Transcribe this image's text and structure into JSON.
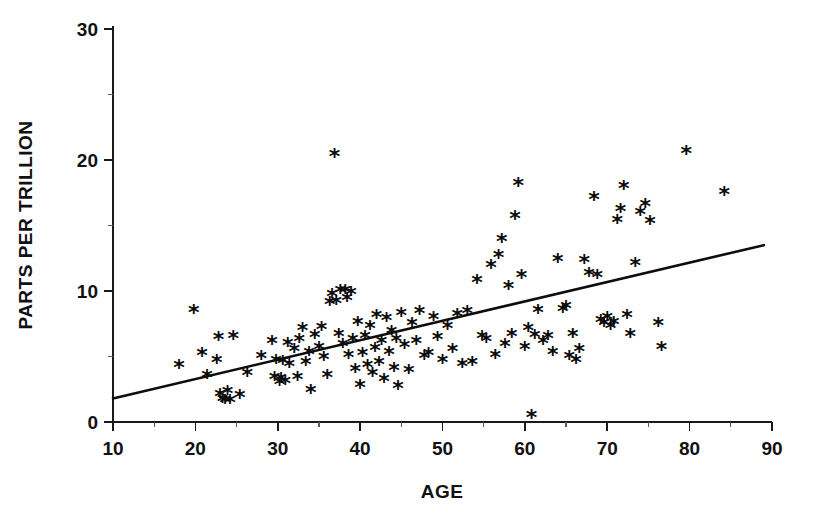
{
  "chart_data": {
    "type": "scatter",
    "title": "",
    "xlabel": "AGE",
    "ylabel": "PARTS PER TRILLION",
    "xlim": [
      10,
      90
    ],
    "ylim": [
      0,
      30
    ],
    "grid": false,
    "legend": null,
    "marker_symbol": "*",
    "marker_color": "#0a0a0a",
    "x_ticks_major": [
      10,
      20,
      30,
      40,
      50,
      60,
      70,
      80,
      90
    ],
    "x_tick_labels": [
      "10",
      "20",
      "30",
      "40",
      "50",
      "60",
      "70",
      "80",
      "90"
    ],
    "x_ticks_minor": [
      15,
      25,
      35,
      45,
      55,
      65,
      75,
      85
    ],
    "y_ticks_major": [
      0,
      10,
      20,
      30
    ],
    "y_tick_labels": [
      "0",
      "10",
      "20",
      "30"
    ],
    "y_ticks_minor": [
      5,
      15,
      25
    ],
    "series": [
      {
        "name": "observations",
        "points": [
          [
            18.0,
            4.2
          ],
          [
            19.8,
            8.4
          ],
          [
            20.8,
            5.1
          ],
          [
            21.4,
            3.4
          ],
          [
            22.6,
            4.6
          ],
          [
            22.8,
            6.3
          ],
          [
            23.0,
            2.0
          ],
          [
            23.3,
            1.6
          ],
          [
            23.6,
            1.5
          ],
          [
            23.9,
            2.2
          ],
          [
            24.2,
            1.5
          ],
          [
            24.6,
            6.4
          ],
          [
            25.4,
            1.9
          ],
          [
            26.3,
            3.6
          ],
          [
            28.0,
            4.9
          ],
          [
            29.3,
            6.0
          ],
          [
            29.6,
            3.3
          ],
          [
            29.8,
            4.6
          ],
          [
            30.2,
            2.9
          ],
          [
            30.4,
            3.2
          ],
          [
            30.6,
            4.5
          ],
          [
            30.9,
            3.0
          ],
          [
            31.2,
            5.9
          ],
          [
            31.4,
            4.3
          ],
          [
            32.0,
            5.4
          ],
          [
            32.4,
            3.3
          ],
          [
            32.6,
            6.2
          ],
          [
            33.0,
            7.0
          ],
          [
            33.4,
            4.4
          ],
          [
            33.8,
            5.2
          ],
          [
            34.0,
            2.3
          ],
          [
            34.5,
            6.5
          ],
          [
            35.0,
            5.6
          ],
          [
            35.3,
            7.1
          ],
          [
            35.6,
            4.8
          ],
          [
            36.0,
            3.4
          ],
          [
            36.3,
            9.0
          ],
          [
            36.6,
            9.6
          ],
          [
            36.9,
            20.3
          ],
          [
            37.1,
            9.1
          ],
          [
            37.4,
            6.6
          ],
          [
            37.6,
            9.9
          ],
          [
            37.9,
            5.8
          ],
          [
            38.2,
            9.9
          ],
          [
            38.4,
            9.3
          ],
          [
            38.6,
            5.0
          ],
          [
            38.9,
            9.8
          ],
          [
            39.1,
            6.2
          ],
          [
            39.4,
            3.9
          ],
          [
            39.7,
            7.5
          ],
          [
            40.0,
            2.7
          ],
          [
            40.3,
            5.1
          ],
          [
            40.6,
            6.4
          ],
          [
            40.9,
            4.2
          ],
          [
            41.2,
            7.2
          ],
          [
            41.5,
            3.6
          ],
          [
            41.8,
            5.5
          ],
          [
            42.0,
            8.0
          ],
          [
            42.3,
            4.4
          ],
          [
            42.6,
            6.0
          ],
          [
            42.9,
            3.1
          ],
          [
            43.2,
            7.8
          ],
          [
            43.5,
            5.2
          ],
          [
            43.8,
            6.8
          ],
          [
            44.1,
            4.0
          ],
          [
            44.4,
            6.2
          ],
          [
            44.6,
            2.6
          ],
          [
            45.0,
            8.2
          ],
          [
            45.4,
            5.7
          ],
          [
            45.9,
            3.8
          ],
          [
            46.3,
            7.4
          ],
          [
            46.8,
            6.0
          ],
          [
            47.2,
            8.3
          ],
          [
            47.8,
            4.9
          ],
          [
            48.3,
            5.1
          ],
          [
            48.9,
            7.9
          ],
          [
            49.4,
            6.3
          ],
          [
            50.0,
            4.6
          ],
          [
            50.6,
            7.2
          ],
          [
            51.2,
            5.4
          ],
          [
            51.8,
            8.1
          ],
          [
            52.4,
            4.3
          ],
          [
            53.0,
            8.3
          ],
          [
            53.6,
            4.4
          ],
          [
            54.2,
            10.7
          ],
          [
            54.8,
            6.4
          ],
          [
            55.3,
            6.2
          ],
          [
            55.9,
            11.8
          ],
          [
            56.4,
            5.0
          ],
          [
            56.8,
            12.6
          ],
          [
            57.2,
            13.8
          ],
          [
            57.6,
            5.8
          ],
          [
            58.0,
            10.2
          ],
          [
            58.4,
            6.6
          ],
          [
            58.8,
            15.6
          ],
          [
            59.2,
            18.1
          ],
          [
            59.6,
            11.1
          ],
          [
            60.0,
            5.6
          ],
          [
            60.4,
            7.0
          ],
          [
            60.8,
            0.4
          ],
          [
            61.2,
            6.5
          ],
          [
            61.6,
            8.4
          ],
          [
            62.2,
            6.0
          ],
          [
            62.8,
            6.4
          ],
          [
            63.4,
            5.2
          ],
          [
            64.0,
            12.3
          ],
          [
            64.6,
            8.5
          ],
          [
            65.0,
            8.7
          ],
          [
            65.4,
            4.9
          ],
          [
            65.8,
            6.6
          ],
          [
            66.2,
            4.6
          ],
          [
            66.6,
            5.4
          ],
          [
            67.2,
            12.2
          ],
          [
            67.8,
            11.2
          ],
          [
            68.4,
            17.0
          ],
          [
            68.8,
            11.1
          ],
          [
            69.2,
            7.6
          ],
          [
            69.6,
            7.4
          ],
          [
            70.0,
            7.9
          ],
          [
            70.4,
            7.2
          ],
          [
            70.8,
            7.5
          ],
          [
            71.2,
            15.3
          ],
          [
            71.6,
            16.1
          ],
          [
            72.0,
            17.9
          ],
          [
            72.4,
            8.0
          ],
          [
            72.8,
            6.6
          ],
          [
            73.4,
            12.0
          ],
          [
            74.0,
            15.9
          ],
          [
            74.6,
            16.5
          ],
          [
            75.2,
            15.2
          ],
          [
            76.2,
            7.4
          ],
          [
            76.6,
            5.6
          ],
          [
            79.6,
            20.5
          ],
          [
            84.2,
            17.4
          ]
        ]
      }
    ],
    "fit_line": {
      "name": "regression-line",
      "x_start": 10,
      "y_start": 1.8,
      "x_end": 89,
      "y_end": 13.5
    }
  },
  "axes": {
    "x_title": "AGE",
    "y_title": "PARTS PER TRILLION"
  }
}
